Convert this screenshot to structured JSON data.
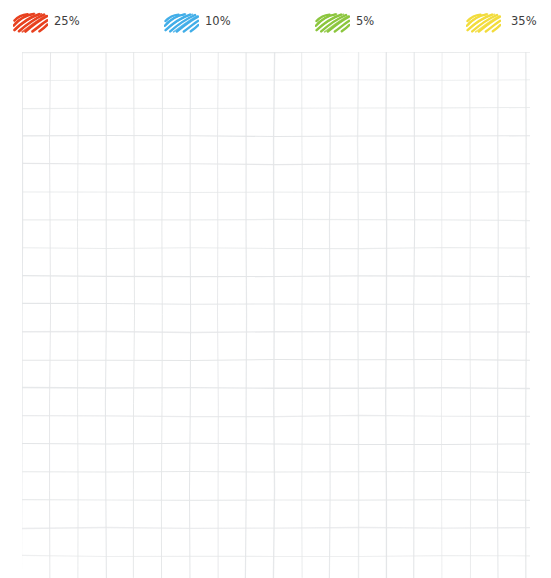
{
  "chart_data": {
    "type": "bar",
    "title": "",
    "xlabel": "",
    "ylabel": "",
    "grid": true,
    "legend_position": "top",
    "categories": [
      "25%",
      "10%",
      "5%",
      "35%"
    ],
    "values": [
      25,
      10,
      5,
      35
    ],
    "series": [
      {
        "name": "25%",
        "value": 25,
        "color": "#E8411F",
        "swatch_style": "hand-drawn-scribble"
      },
      {
        "name": "10%",
        "value": 10,
        "color": "#42AEE8",
        "swatch_style": "hand-drawn-scribble"
      },
      {
        "name": "5%",
        "value": 5,
        "color": "#8CC63E",
        "swatch_style": "hand-drawn-scribble"
      },
      {
        "name": "35%",
        "value": 35,
        "color": "#F2DC3C",
        "swatch_style": "hand-drawn-scribble"
      }
    ],
    "ylim": [
      0,
      100
    ]
  },
  "header": {
    "title_clipped": ""
  },
  "legend": {
    "items": [
      {
        "label": "25%",
        "color": "#E8411F",
        "icon": "scribble-swatch-icon"
      },
      {
        "label": "10%",
        "color": "#42AEE8",
        "icon": "scribble-swatch-icon"
      },
      {
        "label": "5%",
        "color": "#8CC63E",
        "icon": "scribble-swatch-icon"
      },
      {
        "label": "35%",
        "color": "#F2DC3C",
        "icon": "scribble-swatch-icon"
      }
    ]
  },
  "plot": {
    "grid_color": "#E3E5E7",
    "grid_columns": 18,
    "grid_rows": 19,
    "cell_width": 28,
    "cell_height": 28,
    "background": "#FFFFFF"
  }
}
